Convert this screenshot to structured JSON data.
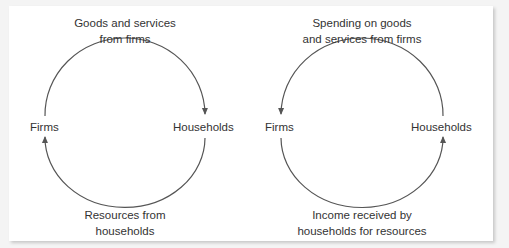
{
  "diagrams": [
    {
      "name": "goods-flow",
      "nodes": {
        "left": "Firms",
        "right": "Households"
      },
      "top_label": [
        "Goods and services",
        "from firms"
      ],
      "bottom_label": [
        "Resources from",
        "households"
      ],
      "top_arrow_direction": "firms-to-households",
      "bottom_arrow_direction": "households-to-firms"
    },
    {
      "name": "money-flow",
      "nodes": {
        "left": "Firms",
        "right": "Households"
      },
      "top_label": [
        "Spending on goods",
        "and services from firms"
      ],
      "bottom_label": [
        "Income received by",
        "households for resources"
      ],
      "top_arrow_direction": "households-to-firms",
      "bottom_arrow_direction": "firms-to-households"
    }
  ],
  "colors": {
    "text": "#333333",
    "arrow": "#555555",
    "background": "#ffffff"
  }
}
